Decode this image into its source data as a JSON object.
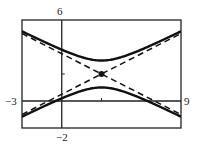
{
  "chart_data": {
    "type": "line",
    "title": "",
    "xlabel": "",
    "ylabel": "",
    "xlim": [
      -3,
      9
    ],
    "ylim": [
      -2,
      6
    ],
    "grid": false,
    "window_labels": {
      "xmin": "−3",
      "xmax": "9",
      "ymin": "−2",
      "ymax": "6"
    },
    "ticks": {
      "x": [
        3
      ],
      "y": [
        2
      ]
    },
    "center": {
      "x": 3,
      "y": 2
    },
    "series": [
      {
        "name": "hyperbola upper branch",
        "style": "solid",
        "equation": "(y-2)^2 - (x-3)^2/4 = 1, y>2"
      },
      {
        "name": "hyperbola lower branch",
        "style": "solid",
        "equation": "(y-2)^2 - (x-3)^2/4 = 1, y<2"
      },
      {
        "name": "asymptote 1",
        "style": "dashed",
        "equation": "y = 2 + (x-3)/2"
      },
      {
        "name": "asymptote 2",
        "style": "dashed",
        "equation": "y = 2 - (x-3)/2"
      }
    ],
    "points": [
      {
        "name": "center",
        "x": 3,
        "y": 2
      }
    ]
  }
}
